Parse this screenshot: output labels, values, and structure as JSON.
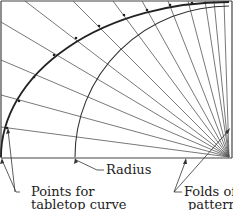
{
  "diagram": {
    "labels": {
      "radius": "Radius",
      "points_line1": "Points for",
      "points_line2": "tabletop curve",
      "folds_line1": "Folds of",
      "folds_line2": "pattern"
    },
    "colors": {
      "line": "#555555",
      "arc": "#222222",
      "frame": "#444444",
      "background": "#ffffff"
    }
  }
}
